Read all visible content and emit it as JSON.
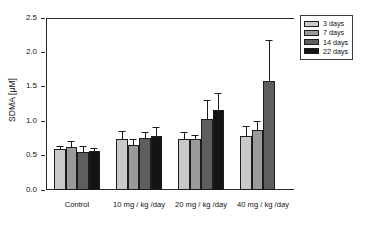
{
  "chart_data": {
    "type": "bar",
    "title": "",
    "subtitle": "",
    "xlabel": "",
    "ylabel": "SDMA [µM]",
    "ylim": [
      0.0,
      2.5
    ],
    "yticks": [
      "0.0",
      "0.5",
      "1.0",
      "1.5",
      "2.0",
      "2.5"
    ],
    "ytick_values": [
      0.0,
      0.5,
      1.0,
      1.5,
      2.0,
      2.5
    ],
    "grid": false,
    "legend_position": "top-right",
    "categories": [
      "Control",
      "10 mg / kg /day",
      "20 mg / kg /day",
      "40 mg / kg /day"
    ],
    "series": [
      {
        "name": "3 days",
        "color": "#c9c9c9",
        "values": [
          0.59,
          0.74,
          0.74,
          0.78
        ],
        "errors": [
          0.03,
          0.1,
          0.09,
          0.13
        ]
      },
      {
        "name": "7 days",
        "color": "#9a9a9a",
        "values": [
          0.63,
          0.66,
          0.74,
          0.87
        ],
        "errors": [
          0.07,
          0.07,
          0.05,
          0.12
        ]
      },
      {
        "name": "14 days",
        "color": "#5e5e5e",
        "values": [
          0.55,
          0.76,
          1.03,
          1.59
        ],
        "errors": [
          0.08,
          0.07,
          0.26,
          0.58
        ]
      },
      {
        "name": "22 days",
        "color": "#141414",
        "values": [
          0.57,
          0.78,
          1.16,
          null
        ],
        "errors": [
          0.02,
          0.12,
          0.23,
          null
        ]
      }
    ]
  },
  "legend": {
    "items": [
      {
        "label": "3 days",
        "color": "#c9c9c9"
      },
      {
        "label": "7 days",
        "color": "#9a9a9a"
      },
      {
        "label": "14 days",
        "color": "#5e5e5e"
      },
      {
        "label": "22 days",
        "color": "#141414"
      }
    ]
  },
  "axis": {
    "y_title": "SDMA [µM]"
  }
}
